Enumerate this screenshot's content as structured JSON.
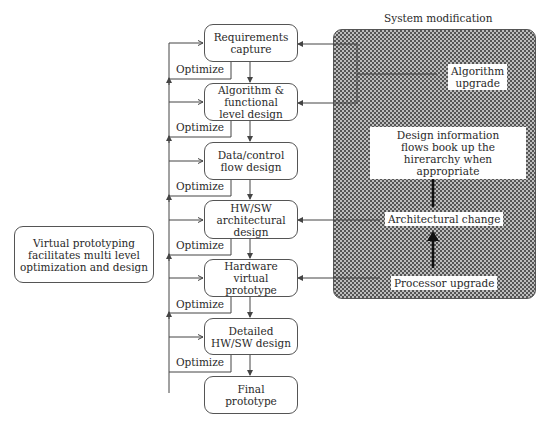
{
  "flow": {
    "steps": [
      {
        "label": "Requirements\ncapture"
      },
      {
        "label": "Algorithm &\nfunctional\nlevel design"
      },
      {
        "label": "Data/control\nflow design"
      },
      {
        "label": "HW/SW\narchitectural\ndesign"
      },
      {
        "label": "Hardware\nvirtual\nprototype"
      },
      {
        "label": "Detailed\nHW/SW design"
      },
      {
        "label": "Final\nprototype"
      }
    ],
    "optimize_label": "Optimize",
    "optimize_labels": [
      "Optimize",
      "Optimize",
      "Optimize",
      "Optimize",
      "Optimize",
      "Optimize"
    ]
  },
  "note": {
    "text": "Virtual prototyping\nfacilitates multi level\noptimization and design"
  },
  "system_modification": {
    "title": "System modification",
    "items": [
      {
        "label": "Algorithm\nupgrade"
      },
      {
        "label": "Design information\nflows book up the\nhirerarchy when appropriate"
      },
      {
        "label": "Architectural change"
      },
      {
        "label": "Processor upgrade"
      }
    ]
  },
  "colors": {
    "line": "#444444",
    "panel_dots": "#555555",
    "background": "#ffffff"
  }
}
